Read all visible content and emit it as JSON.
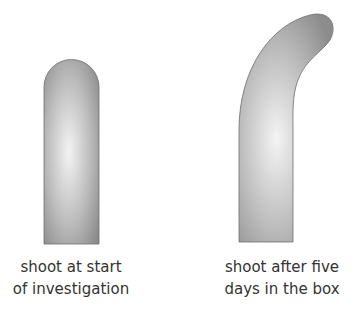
{
  "diagram": {
    "shoots": [
      {
        "name": "shoot-start",
        "caption_lines": [
          "shoot at start",
          "of investigation"
        ]
      },
      {
        "name": "shoot-after",
        "caption_lines": [
          "shoot after five",
          "days in the box"
        ]
      }
    ],
    "colors": {
      "shoot_dark": "#8a8a8a",
      "shoot_light": "#f2f2f2",
      "outline": "#6e6e6e",
      "text": "#333333"
    }
  }
}
